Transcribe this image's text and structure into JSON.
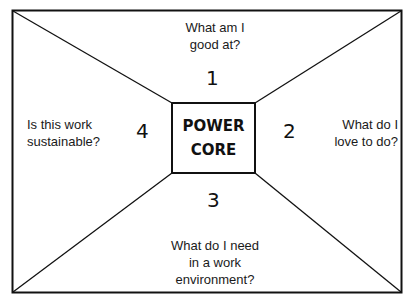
{
  "diagram": {
    "core": {
      "line1": "POWER",
      "line2": "CORE"
    },
    "quadrants": [
      {
        "number": "1",
        "position": "top",
        "question_line1": "What am I",
        "question_line2": "good at?"
      },
      {
        "number": "2",
        "position": "right",
        "question_line1": "What do I",
        "question_line2": "love to do?"
      },
      {
        "number": "3",
        "position": "bottom",
        "question_line1": "What do I need",
        "question_line2": "in a work",
        "question_line3": "environment?"
      },
      {
        "number": "4",
        "position": "left",
        "question_line1": "Is this work",
        "question_line2": "sustainable?"
      }
    ],
    "colors": {
      "stroke": "#111111",
      "background": "#ffffff"
    }
  }
}
